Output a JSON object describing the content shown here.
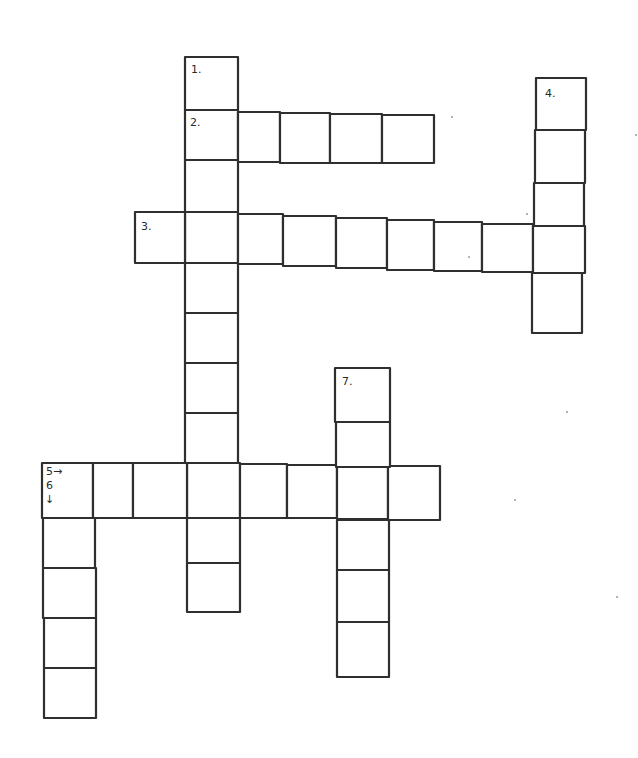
{
  "puzzle": {
    "type": "crossword",
    "style": "hand-drawn",
    "colors": {
      "background": "#ffffff",
      "ink": "#2f2f2f"
    },
    "words": [
      {
        "id": "1",
        "label": "1.",
        "direction": "down",
        "length": 11,
        "cells": [
          [
            185,
            57,
            53,
            53
          ],
          [
            185,
            110,
            53,
            50
          ],
          [
            185,
            160,
            53,
            52
          ],
          [
            185,
            212,
            53,
            51
          ],
          [
            185,
            263,
            53,
            50
          ],
          [
            185,
            313,
            53,
            50
          ],
          [
            185,
            363,
            53,
            50
          ],
          [
            185,
            413,
            53,
            50
          ],
          [
            187,
            463,
            53,
            55
          ],
          [
            187,
            518,
            53,
            45
          ],
          [
            187,
            563,
            53,
            49
          ]
        ]
      },
      {
        "id": "2",
        "label": "2.",
        "direction": "across",
        "length": 5,
        "cells": [
          [
            185,
            110,
            53,
            50
          ],
          [
            238,
            112,
            42,
            50
          ],
          [
            280,
            113,
            50,
            50
          ],
          [
            330,
            114,
            52,
            49
          ],
          [
            382,
            115,
            52,
            48
          ]
        ]
      },
      {
        "id": "3",
        "label": "3.",
        "direction": "across",
        "length": 9,
        "cells": [
          [
            135,
            212,
            50,
            51
          ],
          [
            185,
            212,
            53,
            51
          ],
          [
            238,
            214,
            45,
            50
          ],
          [
            283,
            216,
            53,
            50
          ],
          [
            336,
            218,
            51,
            50
          ],
          [
            387,
            220,
            47,
            50
          ],
          [
            434,
            222,
            48,
            49
          ],
          [
            482,
            224,
            51,
            48
          ],
          [
            533,
            226,
            52,
            47
          ]
        ]
      },
      {
        "id": "4",
        "label": "4.",
        "direction": "down",
        "length": 5,
        "cells": [
          [
            536,
            78,
            50,
            52
          ],
          [
            535,
            130,
            50,
            53
          ],
          [
            534,
            183,
            50,
            43
          ],
          [
            533,
            226,
            52,
            47
          ],
          [
            532,
            273,
            50,
            60
          ]
        ]
      },
      {
        "id": "5",
        "label": "5→",
        "direction": "across",
        "length": 8,
        "cells": [
          [
            42,
            463,
            51,
            55
          ],
          [
            93,
            463,
            40,
            55
          ],
          [
            133,
            463,
            54,
            55
          ],
          [
            187,
            463,
            53,
            55
          ],
          [
            240,
            464,
            47,
            54
          ],
          [
            287,
            465,
            50,
            53
          ],
          [
            337,
            466,
            51,
            53
          ],
          [
            388,
            466,
            52,
            54
          ]
        ]
      },
      {
        "id": "6",
        "label": "6↓",
        "direction": "down",
        "length": 5,
        "cells": [
          [
            42,
            463,
            51,
            55
          ],
          [
            43,
            518,
            52,
            50
          ],
          [
            43,
            568,
            53,
            50
          ],
          [
            44,
            618,
            52,
            50
          ],
          [
            44,
            668,
            52,
            50
          ]
        ]
      },
      {
        "id": "7",
        "label": "7.",
        "direction": "down",
        "length": 7,
        "cells": [
          [
            335,
            368,
            55,
            54
          ],
          [
            336,
            422,
            54,
            45
          ],
          [
            337,
            466,
            51,
            53
          ],
          [
            337,
            520,
            52,
            50
          ],
          [
            337,
            570,
            52,
            52
          ],
          [
            337,
            622,
            52,
            55
          ]
        ]
      }
    ],
    "labels": [
      {
        "text": "1.",
        "x": 191,
        "y": 73
      },
      {
        "text": "2.",
        "x": 190,
        "y": 126
      },
      {
        "text": "3.",
        "x": 141,
        "y": 230
      },
      {
        "text": "4.",
        "x": 545,
        "y": 97
      },
      {
        "text": "7.",
        "x": 342,
        "y": 385
      },
      {
        "text": "5→",
        "x": 46,
        "y": 475
      },
      {
        "text": "6",
        "x": 46,
        "y": 489
      },
      {
        "text": "↓",
        "x": 45,
        "y": 503
      }
    ],
    "specks": [
      [
        452,
        117
      ],
      [
        527,
        214
      ],
      [
        469,
        257
      ],
      [
        636,
        135
      ],
      [
        567,
        412
      ],
      [
        617,
        597
      ],
      [
        515,
        500
      ]
    ]
  }
}
